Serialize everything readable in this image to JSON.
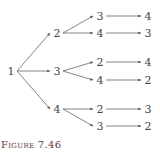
{
  "figure": {
    "caption": "Figure 7.46"
  },
  "tree": {
    "root": {
      "label": "1",
      "x": 11,
      "y": 71
    },
    "level1": [
      {
        "label": "2",
        "x": 57,
        "y": 33
      },
      {
        "label": "3",
        "x": 57,
        "y": 71
      },
      {
        "label": "4",
        "x": 57,
        "y": 109
      }
    ],
    "level2": [
      {
        "label": "3",
        "parent": 0,
        "x": 100,
        "y": 16
      },
      {
        "label": "4",
        "parent": 0,
        "x": 100,
        "y": 33
      },
      {
        "label": "2",
        "parent": 1,
        "x": 100,
        "y": 62
      },
      {
        "label": "4",
        "parent": 1,
        "x": 100,
        "y": 80
      },
      {
        "label": "2",
        "parent": 2,
        "x": 100,
        "y": 109
      },
      {
        "label": "3",
        "parent": 2,
        "x": 100,
        "y": 126
      }
    ],
    "level3": [
      {
        "label": "4",
        "parent": 0,
        "x": 148,
        "y": 16
      },
      {
        "label": "3",
        "parent": 1,
        "x": 148,
        "y": 33
      },
      {
        "label": "4",
        "parent": 2,
        "x": 148,
        "y": 62
      },
      {
        "label": "2",
        "parent": 3,
        "x": 148,
        "y": 80
      },
      {
        "label": "3",
        "parent": 4,
        "x": 148,
        "y": 109
      },
      {
        "label": "2",
        "parent": 5,
        "x": 148,
        "y": 126
      }
    ]
  },
  "colors": {
    "edge": "#666666",
    "node_text": "#444444",
    "caption": "#5a3a33"
  }
}
